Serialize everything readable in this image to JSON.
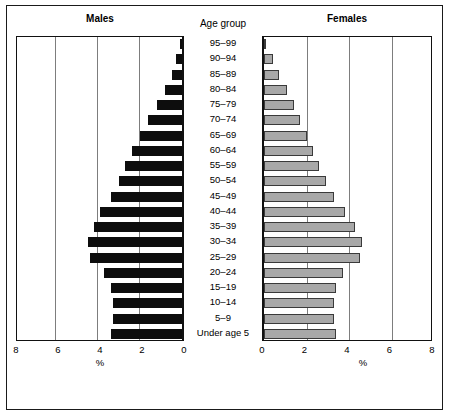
{
  "figure": {
    "male_title": "Males",
    "female_title": "Females",
    "age_group_title": "Age group",
    "male_axis_label": "%",
    "female_axis_label": "%"
  },
  "chart_data": {
    "type": "bar",
    "title": "",
    "subtitle": "",
    "orientation": "horizontal",
    "layout": "population-pyramid",
    "xlabel": "%",
    "ylabel": "Age group",
    "xlim": [
      0,
      8
    ],
    "grid": true,
    "grid_values": [
      2,
      4,
      6
    ],
    "legend_position": "none",
    "male_ticks": [
      "8",
      "6",
      "4",
      "2",
      "0"
    ],
    "male_tick_values": [
      8,
      6,
      4,
      2,
      0
    ],
    "female_ticks": [
      "0",
      "2",
      "4",
      "6",
      "8"
    ],
    "female_tick_values": [
      0,
      2,
      4,
      6,
      8
    ],
    "categories": [
      "95–99",
      "90–94",
      "85–89",
      "80–84",
      "75–79",
      "70–74",
      "65–69",
      "60–64",
      "55–59",
      "50–54",
      "45–49",
      "40–44",
      "35–39",
      "30–34",
      "25–29",
      "20–24",
      "15–19",
      "10–14",
      "5–9",
      "Under age 5"
    ],
    "series": [
      {
        "name": "Males",
        "color": "#0d0d0d",
        "values": [
          0.1,
          0.3,
          0.5,
          0.8,
          1.2,
          1.6,
          2.0,
          2.4,
          2.7,
          3.0,
          3.4,
          3.9,
          4.2,
          4.5,
          4.4,
          3.7,
          3.4,
          3.3,
          3.3,
          3.4
        ]
      },
      {
        "name": "Females",
        "color": "#a8a8a8",
        "values": [
          0.1,
          0.4,
          0.7,
          1.1,
          1.4,
          1.7,
          2.0,
          2.3,
          2.6,
          2.9,
          3.3,
          3.8,
          4.3,
          4.6,
          4.5,
          3.7,
          3.4,
          3.3,
          3.3,
          3.4
        ]
      }
    ]
  }
}
